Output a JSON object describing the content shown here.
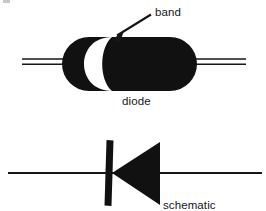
{
  "figure": {
    "background_color": "#ffffff",
    "ink_color": "#111111",
    "width": 266,
    "height": 211
  },
  "labels": {
    "band": "band",
    "diode": "diode",
    "schematic_symbol_equivalent": "schematic\nsymbol\nequivalent",
    "schematic_line_1": "schematic",
    "schematic_line_2": "symbol",
    "schematic_line_3": "equivalent"
  },
  "drawing": {
    "diode_body": {
      "shape": "stadium",
      "x": 62,
      "y": 37,
      "width": 135,
      "height": 54,
      "fill": "#111111"
    },
    "cathode_band": {
      "shape": "crescent",
      "fill": "#ffffff",
      "description": "white crescent stripe near left third of body"
    },
    "left_lead": {
      "x1": 22,
      "x2": 70,
      "y_top": 59,
      "y_bottom": 64,
      "style": "double-line"
    },
    "right_lead": {
      "x1": 190,
      "x2": 246,
      "y_top": 59,
      "y_bottom": 64,
      "style": "double-line"
    },
    "pointer_arrow": {
      "from_x": 152,
      "from_y": 14,
      "to_x": 112,
      "to_y": 39,
      "points_to": "cathode_band"
    },
    "symbol_wire": {
      "x1": 8,
      "x2": 262,
      "y": 173
    },
    "symbol_bar": {
      "x": 106,
      "y_top": 140,
      "y_bottom": 206,
      "thickness": 7,
      "role": "cathode"
    },
    "symbol_triangle": {
      "apex_x": 112,
      "apex_y": 173,
      "base_x": 160,
      "base_y_top": 142,
      "base_y_bottom": 205,
      "role": "anode",
      "points": "left"
    }
  }
}
